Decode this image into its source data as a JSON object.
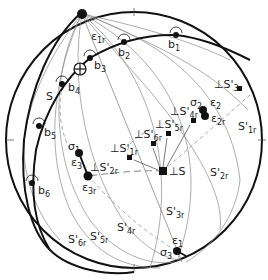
{
  "diagram": {
    "type": "stereographic-projection",
    "primitive": {
      "cx": 134,
      "cy": 140,
      "r": 128
    },
    "ticks": [
      "N",
      "E",
      "S",
      "W"
    ],
    "points": {
      "b": [
        {
          "id": "b1",
          "label": "b",
          "sub": "1",
          "x": 176,
          "y": 35
        },
        {
          "id": "b2",
          "label": "b",
          "sub": "2",
          "x": 124,
          "y": 42
        },
        {
          "id": "b3",
          "label": "b",
          "sub": "3",
          "x": 90,
          "y": 58
        },
        {
          "id": "b4",
          "label": "b",
          "sub": "4",
          "x": 62,
          "y": 84
        },
        {
          "id": "b5",
          "label": "b",
          "sub": "5",
          "x": 39,
          "y": 126
        },
        {
          "id": "b6",
          "label": "b",
          "sub": "6",
          "x": 32,
          "y": 183
        }
      ],
      "eps1r": {
        "label": "ε",
        "sub": "1r",
        "x": 82,
        "y": 37
      },
      "pole_cross": {
        "x": 80,
        "y": 69
      },
      "sigma1": {
        "label": "σ",
        "sub": "1",
        "x": 79,
        "y": 153
      },
      "eps3": {
        "label": "ε",
        "sub": "3",
        "x": 79,
        "y": 153
      },
      "eps3r": {
        "label": "ε",
        "sub": "3r",
        "x": 88,
        "y": 176
      },
      "sigma2": {
        "label": "σ",
        "sub": "2",
        "x": 203,
        "y": 110
      },
      "eps2": {
        "label": "ε",
        "sub": "2",
        "x": 203,
        "y": 110
      },
      "eps2r": {
        "label": "ε",
        "sub": "2r",
        "x": 205,
        "y": 115
      },
      "sigma3": {
        "label": "σ",
        "sub": "3",
        "x": 177,
        "y": 251
      },
      "eps1": {
        "label": "ε",
        "sub": "1",
        "x": 177,
        "y": 251
      }
    },
    "poles": [
      {
        "id": "perpS",
        "label": "⊥S",
        "x": 163,
        "y": 171,
        "big": true
      },
      {
        "id": "perpS1r",
        "label": "⊥S'",
        "sub": "1r",
        "x": 129,
        "y": 157
      },
      {
        "id": "perpS2r",
        "label": "⊥S'",
        "sub": "2r",
        "x": 88,
        "y": 176
      },
      {
        "id": "perpS3r",
        "label": "⊥S'",
        "sub": "3r",
        "x": 239,
        "y": 88
      },
      {
        "id": "perpS4r",
        "label": "⊥S'",
        "sub": "4r",
        "x": 193,
        "y": 120
      },
      {
        "id": "perpS5r",
        "label": "⊥S'",
        "sub": "5r",
        "x": 168,
        "y": 133
      },
      {
        "id": "perpS6r",
        "label": "⊥S'",
        "sub": "6r",
        "x": 153,
        "y": 143
      }
    ],
    "plane_labels": [
      {
        "label": "S",
        "sub": "",
        "x": 44,
        "y": 101
      },
      {
        "label": "S'",
        "sub": "1r",
        "x": 238,
        "y": 130
      },
      {
        "label": "S'",
        "sub": "2r",
        "x": 210,
        "y": 176
      },
      {
        "label": "S'",
        "sub": "3r",
        "x": 166,
        "y": 215
      },
      {
        "label": "S'",
        "sub": "4r",
        "x": 117,
        "y": 229
      },
      {
        "label": "S'",
        "sub": "5r",
        "x": 91,
        "y": 241
      },
      {
        "label": "S'",
        "sub": "6r",
        "x": 68,
        "y": 243
      }
    ]
  }
}
